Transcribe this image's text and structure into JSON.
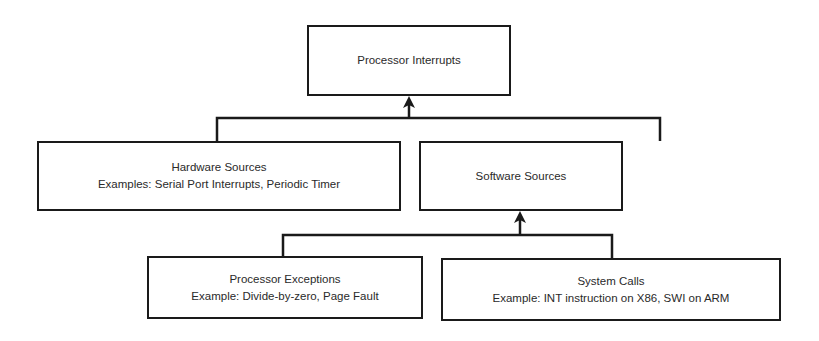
{
  "diagram": {
    "type": "hierarchy",
    "root": {
      "title": "Processor Interrupts"
    },
    "level1": [
      {
        "title": "Hardware Sources",
        "subtitle": "Examples: Serial Port Interrupts, Periodic Timer"
      },
      {
        "title": "Software Sources",
        "subtitle": ""
      }
    ],
    "level2": [
      {
        "title": "Processor Exceptions",
        "subtitle": "Example: Divide-by-zero, Page Fault"
      },
      {
        "title": "System Calls",
        "subtitle": "Example: INT instruction on X86, SWI on ARM"
      }
    ],
    "edges": [
      {
        "from": "Hardware Sources",
        "to": "Processor Interrupts"
      },
      {
        "from": "Software Sources",
        "to": "Processor Interrupts"
      },
      {
        "from": "Processor Exceptions",
        "to": "Software Sources"
      },
      {
        "from": "System Calls",
        "to": "Software Sources"
      }
    ],
    "colors": {
      "line": "#1a1a1a",
      "text": "#2a2a2a",
      "background": "#ffffff"
    }
  }
}
